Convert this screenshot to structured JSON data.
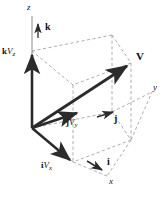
{
  "figure": {
    "name": "vector-components-3d-diagram",
    "colors": {
      "background": "#ffffff",
      "vector_solid": "#2b2b2b",
      "box_dashed": "#9a9a9a",
      "axis_thin": "#5a5a5a",
      "text": "#111111"
    }
  },
  "axes": [
    {
      "id": "z",
      "label": "z",
      "label_x": 27,
      "label_y": 4
    },
    {
      "id": "y",
      "label": "y",
      "label_x": 153,
      "label_y": 84
    },
    {
      "id": "x",
      "label": "x",
      "label_x": 109,
      "label_y": 178
    }
  ],
  "unit_vectors": [
    {
      "id": "k",
      "label": "k",
      "label_x": 45,
      "label_y": 23
    },
    {
      "id": "j",
      "label": "j",
      "label_x": 114,
      "label_y": 115
    },
    {
      "id": "i",
      "label": "i",
      "label_x": 107,
      "label_y": 158
    }
  ],
  "component_vectors": [
    {
      "id": "kVz",
      "bold_part": "k",
      "italic_part": "V",
      "subscript": "z",
      "label_x": 2,
      "label_y": 48
    },
    {
      "id": "jVy",
      "bold_part": "j",
      "italic_part": "V",
      "subscript": "y",
      "label_x": 66,
      "label_y": 119
    },
    {
      "id": "iVx",
      "bold_part": "i",
      "italic_part": "V",
      "subscript": "x",
      "label_x": 41,
      "label_y": 162
    }
  ],
  "resultant_vector": {
    "id": "V",
    "label": "V",
    "label_x": 136,
    "label_y": 52
  },
  "geometry": {
    "origin": [
      32,
      128
    ],
    "z_top": [
      32,
      16
    ],
    "kVz_tip": [
      32,
      51
    ],
    "V_tip": [
      131,
      63
    ],
    "jVy_tip": [
      80,
      112
    ],
    "iVx_tip": [
      73,
      162
    ],
    "y_axis_end": [
      152,
      92
    ],
    "x_axis_end": [
      107,
      176
    ],
    "box_back_top": [
      112,
      35
    ],
    "box_left_top": [
      32,
      51
    ],
    "box_right_top": [
      131,
      63
    ],
    "box_front_top": [
      73,
      85
    ],
    "box_back_bottom": [
      112,
      112
    ],
    "box_right_bottom": [
      131,
      140
    ],
    "box_front_bottom": [
      73,
      162
    ]
  }
}
